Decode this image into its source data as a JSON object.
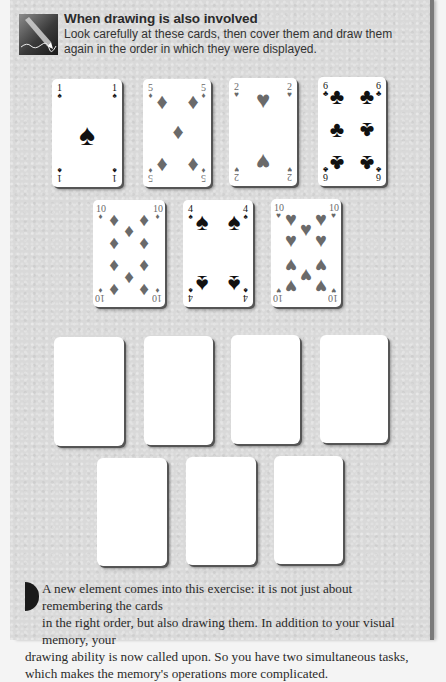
{
  "header": {
    "icon": "pencil-drawing-icon",
    "title": "When drawing is also involved",
    "description": "Look carefully at these cards, then cover them and draw them again in the order in which they were displayed."
  },
  "colors": {
    "panel_bg": "#d9d9d9",
    "black_suit": "#111111",
    "red_suit_printed": "#6a6a6a",
    "card_bg": "#ffffff"
  },
  "cards": [
    {
      "rank": "1",
      "suit": "spades",
      "glyph": "♠",
      "tone": "black"
    },
    {
      "rank": "5",
      "suit": "diamonds",
      "glyph": "♦",
      "tone": "grey"
    },
    {
      "rank": "2",
      "suit": "hearts",
      "glyph": "♥",
      "tone": "grey"
    },
    {
      "rank": "6",
      "suit": "clubs",
      "glyph": "♣",
      "tone": "black"
    },
    {
      "rank": "10",
      "suit": "diamonds",
      "glyph": "♦",
      "tone": "grey"
    },
    {
      "rank": "4",
      "suit": "spades",
      "glyph": "♠",
      "tone": "black"
    },
    {
      "rank": "10",
      "suit": "hearts",
      "glyph": "♥",
      "tone": "grey"
    }
  ],
  "blank_cards_count": 7,
  "body": {
    "line1": "A new element comes into this exercise: it is not just about remembering the cards",
    "line2": "in the right order, but also drawing them. In addition to your visual memory, your",
    "rest": "drawing ability is now called upon. So you have two simultaneous tasks, which makes the memory's operations more complicated."
  }
}
